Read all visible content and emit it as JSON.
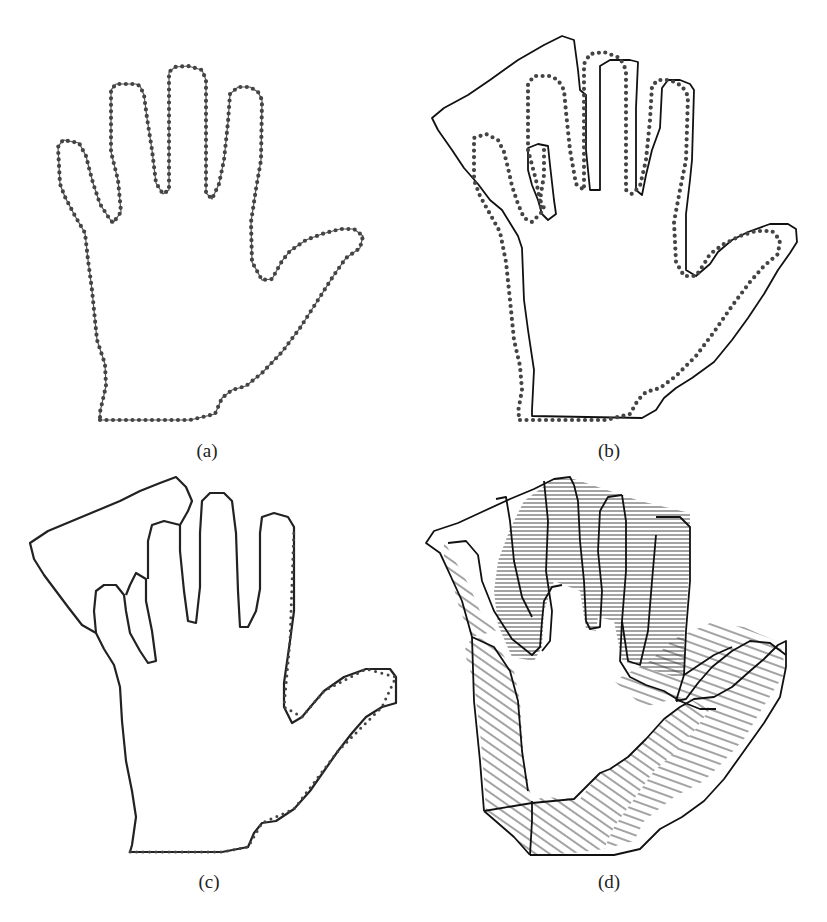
{
  "figure": {
    "panels": [
      {
        "id": "a",
        "label": "(a)",
        "description": "Dotted outline of an open hand (contour points)"
      },
      {
        "id": "b",
        "label": "(b)",
        "description": "Dotted hand contour overlaid with a deformed solid contour"
      },
      {
        "id": "c",
        "label": "(c)",
        "description": "Aligned contour of the hand with bent fingers region"
      },
      {
        "id": "d",
        "label": "(d)",
        "description": "Correspondence lines (hatching) between two hand contours"
      }
    ]
  }
}
